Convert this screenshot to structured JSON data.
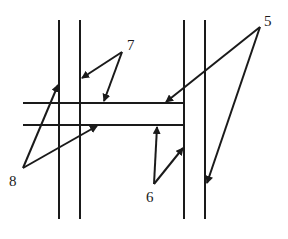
{
  "diagram": {
    "type": "technical-line-drawing",
    "stroke_color": "#1a1a1a",
    "background": "#ffffff",
    "vertical_lines": [
      {
        "id": "v1",
        "x": 59,
        "y1": 20,
        "y2": 219
      },
      {
        "id": "v2",
        "x": 80,
        "y1": 20,
        "y2": 219
      },
      {
        "id": "v3",
        "x": 184,
        "y1": 20,
        "y2": 219
      },
      {
        "id": "v4",
        "x": 205,
        "y1": 20,
        "y2": 219
      }
    ],
    "horizontal_lines": [
      {
        "id": "h1",
        "y": 103,
        "x1": 23,
        "x2": 184
      },
      {
        "id": "h2",
        "y": 125,
        "x1": 23,
        "x2": 184
      }
    ],
    "labels": [
      {
        "text": "5",
        "x": 264,
        "y": 14
      },
      {
        "text": "7",
        "x": 127,
        "y": 38
      },
      {
        "text": "8",
        "x": 9,
        "y": 174
      },
      {
        "text": "6",
        "x": 146,
        "y": 190
      }
    ],
    "leaders": [
      {
        "label": "5",
        "from": [
          260,
          27
        ],
        "to": [
          166,
          102
        ]
      },
      {
        "label": "5",
        "from": [
          260,
          27
        ],
        "to": [
          207,
          183
        ]
      },
      {
        "label": "7",
        "from": [
          122,
          52
        ],
        "to": [
          82,
          78
        ]
      },
      {
        "label": "7",
        "from": [
          122,
          52
        ],
        "to": [
          104,
          101
        ]
      },
      {
        "label": "8",
        "from": [
          23,
          168
        ],
        "to": [
          58,
          85
        ]
      },
      {
        "label": "8",
        "from": [
          23,
          168
        ],
        "to": [
          97,
          126
        ]
      },
      {
        "label": "6",
        "from": [
          154,
          184
        ],
        "to": [
          157,
          127
        ]
      },
      {
        "label": "6",
        "from": [
          154,
          184
        ],
        "to": [
          183,
          148
        ]
      }
    ]
  }
}
